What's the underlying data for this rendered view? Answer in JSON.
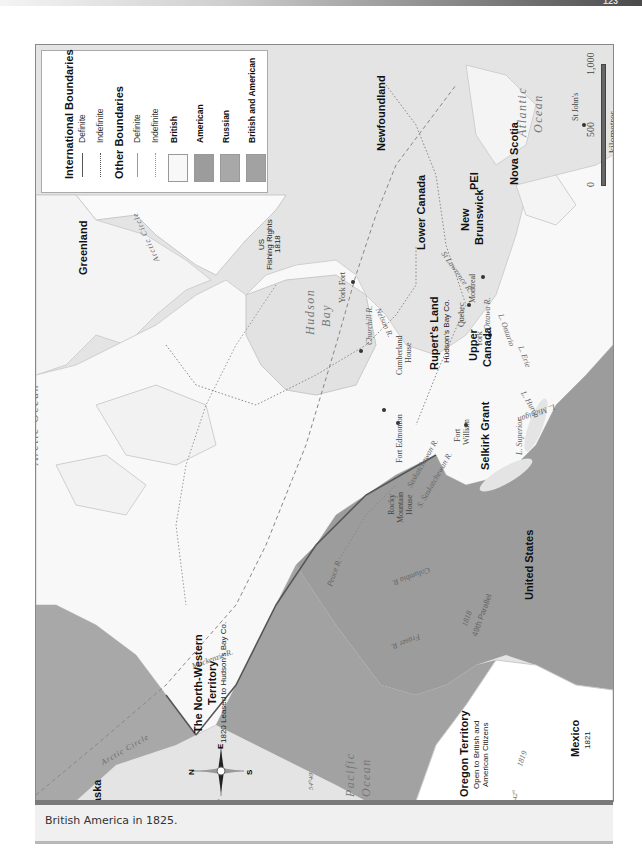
{
  "header": {
    "page_number": "123"
  },
  "caption": "British America in 1825.",
  "colors": {
    "british": "#f7f7f7",
    "american": "#9a9a9a",
    "russian": "#a8a8a8",
    "british_and_american": "#a2a2a2",
    "water": "#e3e3e3",
    "other_land": "#ffffff"
  },
  "legend": {
    "international_boundaries": "International Boundaries",
    "intl_definite": "Definite",
    "intl_indefinite": "Indefinite",
    "other_boundaries": "Other Boundaries",
    "other_definite": "Definite",
    "other_indefinite": "Indefinite",
    "british": "British",
    "american": "American",
    "russian": "Russian",
    "british_and_american": "British and American"
  },
  "scale": {
    "ticks": [
      "0",
      "500",
      "1,000"
    ],
    "unit": "kilometres"
  },
  "oceans": {
    "arctic": "Arctic Ocean",
    "atlantic_1": "Atlantic",
    "atlantic_2": "Ocean",
    "pacific_1": "Pacific",
    "pacific_2": "Ocean",
    "hudson_1": "Hudson",
    "hudson_2": "Bay"
  },
  "regions": {
    "greenland": "Greenland",
    "newfoundland": "Newfoundland",
    "nova_scotia": "Nova Scotia",
    "pei": "PEI",
    "new_brunswick_1": "New",
    "new_brunswick_2": "Brunswick",
    "lower_canada": "Lower Canada",
    "upper_canada_1": "Upper",
    "upper_canada_2": "Canada",
    "ruperts_land": "Rupert's Land",
    "ruperts_land_sub": "Hudson's Bay Co.",
    "selkirk_grant": "Selkirk Grant",
    "united_states": "United States",
    "mexico": "Mexico",
    "mexico_sub": "1821",
    "oregon": "Oregon Territory",
    "oregon_sub_1": "Open to British and",
    "oregon_sub_2": "American Citizens",
    "nw_territory_1": "The North-Western",
    "nw_territory_2": "Territory",
    "nw_territory_sub": "1820 Leased to Hudson's Bay Co.",
    "alaska": "Alaska",
    "us_fishing_1": "US",
    "us_fishing_2": "Fishing Rights",
    "us_fishing_3": "1818"
  },
  "places": {
    "st_johns": "St John's",
    "quebec": "Quebec",
    "montreal": "Montreal",
    "york": "York",
    "fort_william_1": "Fort",
    "fort_william_2": "William",
    "york_fort": "York Fort",
    "cumberland_1": "Cumberland",
    "cumberland_2": "House",
    "fort_edmonton": "Fort Edmonton",
    "rocky_1": "Rocky",
    "rocky_2": "Mountain",
    "rocky_3": "House"
  },
  "rivers": {
    "st_lawrence": "St Lawrence R.",
    "ottawa": "Ottawa R.",
    "l_ontario": "L. Ontario",
    "l_erie": "L. Erie",
    "l_huron": "L. Huron",
    "l_michigan": "L. Michigan",
    "l_superior": "L. Superior",
    "churchill": "Churchill R.",
    "nelson": "Nelson R.",
    "saskatchewan": "Saskatchewan R.",
    "s_saskatchewan": "S. Saskatchewan R.",
    "peace": "Peace R.",
    "mackenzie": "Mackenzie R.",
    "columbia": "Columbia R.",
    "fraser": "Fraser R."
  },
  "annotations": {
    "arctic_circle_1": "Arctic Circle",
    "arctic_circle_2": "Arctic Circle",
    "parallel_49": "49th Parallel",
    "year_1818": "1818",
    "year_1819": "1819",
    "lat_5440": "54°40'",
    "lat_42": "42°"
  },
  "compass": {
    "n": "N",
    "s": "S",
    "e": "E",
    "w": "W"
  }
}
